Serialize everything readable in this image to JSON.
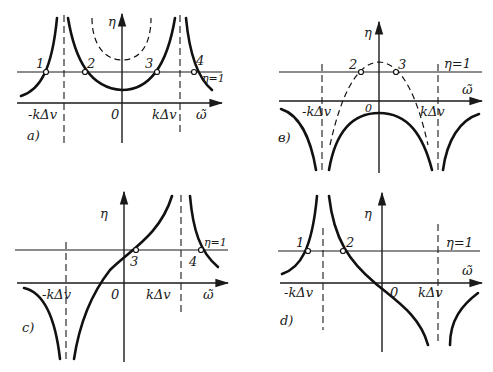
{
  "panels": [
    {
      "id": "a",
      "caption": "a)",
      "y_label": "η",
      "x_label": "ω̃",
      "eta_label": "η=1",
      "origin_label": "0",
      "left_asymptote_label": "-kΔv",
      "right_asymptote_label": "kΔv",
      "points": [
        "1",
        "2",
        "3",
        "4"
      ]
    },
    {
      "id": "b",
      "caption": "в)",
      "y_label": "η",
      "x_label": "ω̃",
      "eta_label": "η=1",
      "origin_label": "0",
      "left_asymptote_label": "-kΔv",
      "right_asymptote_label": "kΔv",
      "points": [
        "2",
        "3"
      ]
    },
    {
      "id": "c",
      "caption": "c)",
      "y_label": "η",
      "x_label": "ω̃",
      "eta_label": "η=1",
      "origin_label": "0",
      "left_asymptote_label": "-kΔv",
      "right_asymptote_label": "kΔv",
      "points": [
        "3",
        "4"
      ]
    },
    {
      "id": "d",
      "caption": "d)",
      "y_label": "η",
      "x_label": "ω̃",
      "eta_label": "η=1",
      "origin_label": "0",
      "left_asymptote_label": "-kΔv",
      "right_asymptote_label": "kΔv",
      "points": [
        "1",
        "2"
      ]
    }
  ]
}
